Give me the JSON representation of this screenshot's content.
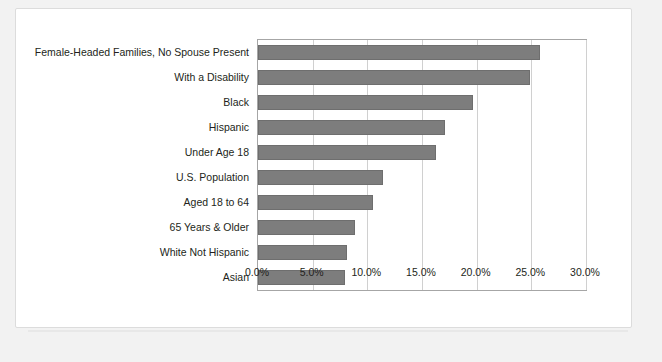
{
  "chart_data": {
    "type": "bar",
    "orientation": "horizontal",
    "title": "",
    "subtitle": "",
    "xlabel": "",
    "ylabel": "",
    "xlim": [
      0,
      30
    ],
    "xtick_labels": [
      "0.0%",
      "5.0%",
      "10.0%",
      "15.0%",
      "20.0%",
      "25.0%",
      "30.0%"
    ],
    "xtick_values": [
      0,
      5,
      10,
      15,
      20,
      25,
      30
    ],
    "grid": "vertical-only",
    "legend": "none",
    "bar_color": "#7d7d7d",
    "bar_edge_color": "#6e6e6e",
    "plot_border_color": "#a6a6a6",
    "gridline_color": "#d0d0d0",
    "categories": [
      "Female-Headed Families, No Spouse Present",
      "With a Disability",
      "Black",
      "Hispanic",
      "Under Age 18",
      "U.S. Population",
      "Aged 18 to 64",
      "65 Years & Older",
      "White Not Hispanic",
      "Asian"
    ],
    "values": [
      25.8,
      24.9,
      19.7,
      17.1,
      16.3,
      11.4,
      10.5,
      8.9,
      8.1,
      8.0
    ]
  }
}
